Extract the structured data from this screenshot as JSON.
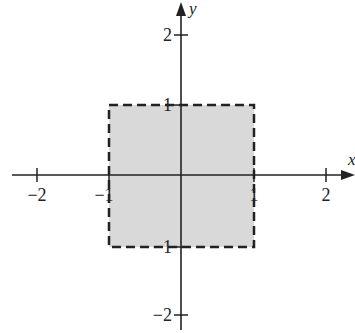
{
  "diagram": {
    "type": "coordinate-plane-region",
    "axes": {
      "x_label": "x",
      "y_label": "y",
      "x_ticks": [
        {
          "value": -2,
          "label": "−2"
        },
        {
          "value": -1,
          "label": "−1"
        },
        {
          "value": 1,
          "label": "1"
        },
        {
          "value": 2,
          "label": "2"
        }
      ],
      "y_ticks": [
        {
          "value": 2,
          "label": "2"
        },
        {
          "value": 1,
          "label": "1"
        },
        {
          "value": -1,
          "label": "−1"
        },
        {
          "value": -2,
          "label": "−2"
        }
      ]
    },
    "region": {
      "x_min": -1,
      "x_max": 1,
      "y_min": -1,
      "y_max": 1,
      "boundary": "dashed",
      "fill_color": "#d9d9d9",
      "stroke_color": "#222222"
    }
  }
}
